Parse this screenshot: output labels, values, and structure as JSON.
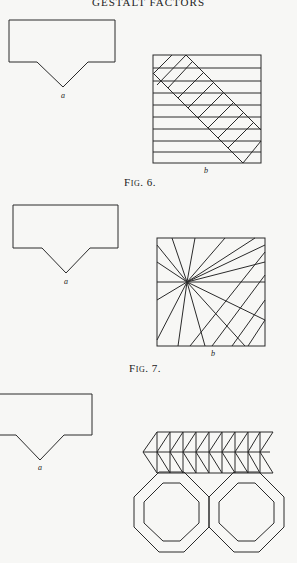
{
  "page": {
    "running_header": "GESTALT FACTORS"
  },
  "figures": [
    {
      "id": "fig6",
      "caption": "Fig. 6.",
      "labels": {
        "a": "a",
        "b": "b"
      },
      "a": "pentagon-like shape (rectangle with V notch at bottom)",
      "b": "square with horizontal lines and diagonal band of parallel strokes"
    },
    {
      "id": "fig7",
      "caption": "Fig. 7.",
      "labels": {
        "a": "a",
        "b": "b"
      },
      "a": "pentagon-like shape (rectangle with V notch at bottom)",
      "b": "square with lines radiating from a point"
    },
    {
      "id": "fig8",
      "caption": "",
      "labels": {
        "a": "a"
      },
      "a": "pentagon-like shape (rectangle with V notch at bottom)",
      "b": "zigzag band of triangles above two concentric octagons"
    }
  ]
}
